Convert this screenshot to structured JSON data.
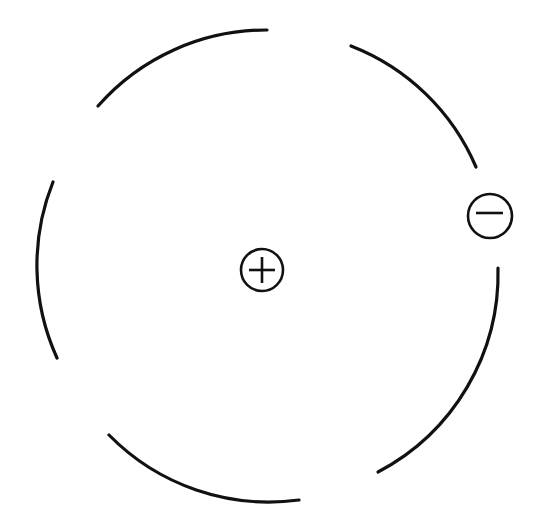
{
  "diagram": {
    "orbit": {
      "center": [
        270,
        268
      ],
      "radius": 224,
      "stroke_color": "#111111",
      "segments": [
        {
          "name": "orbit-arc-top-left",
          "start": [
            98,
            106
          ],
          "end": [
            267,
            30
          ]
        },
        {
          "name": "orbit-arc-top-right",
          "start": [
            351,
            46
          ],
          "end": [
            476,
            167
          ]
        },
        {
          "name": "orbit-arc-right",
          "start": [
            498,
            268
          ],
          "end": [
            378,
            472
          ]
        },
        {
          "name": "orbit-arc-bottom",
          "start": [
            299,
            500
          ],
          "end": [
            109,
            435
          ]
        },
        {
          "name": "orbit-arc-left",
          "start": [
            57,
            358
          ],
          "end": [
            53,
            182
          ]
        }
      ]
    },
    "nucleus": {
      "label": "+",
      "charge": "positive",
      "center": [
        262,
        270
      ],
      "radius": 21
    },
    "electron": {
      "label": "−",
      "charge": "negative",
      "center": [
        490,
        216
      ],
      "radius": 22
    }
  }
}
